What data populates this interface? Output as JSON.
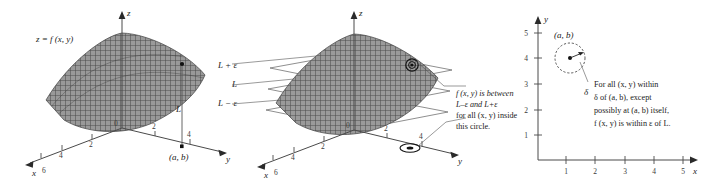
{
  "figure": {
    "kind": "three-panel-diagram",
    "topic": "epsilon-delta definition of a limit of a function of two variables",
    "ink_color": "#1a1a1a",
    "surface_color": "#8a8a8a",
    "axis_color": "#4a4a4a"
  },
  "panel_left": {
    "surface_label": "z = f (x, y)",
    "axes": {
      "z": "z",
      "y": "y",
      "x": "x"
    },
    "origin_label": "0",
    "x_ticks": [
      "2",
      "4",
      "6"
    ],
    "y_ticks": [
      "2",
      "4"
    ],
    "level_labels": [
      "L + ε",
      "L",
      "L − ε"
    ],
    "vertical_segment_label": "L",
    "base_point_label": "(a, b)"
  },
  "panel_mid": {
    "axes": {
      "z": "z",
      "y": "y",
      "x": "x"
    },
    "origin_label": "0",
    "x_ticks": [
      "2",
      "4",
      "6"
    ],
    "y_ticks": [
      "2",
      "4"
    ],
    "level_labels": [
      "L + ε",
      "L",
      "L − ε"
    ],
    "caption_lines": [
      "f (x, y) is between",
      "L–ε and L+ε",
      "for all (x, y) inside",
      "this circle."
    ]
  },
  "panel_right": {
    "axes": {
      "y": "y",
      "x": "x"
    },
    "x_ticks": [
      "1",
      "2",
      "3",
      "4",
      "5"
    ],
    "y_ticks": [
      "1",
      "2",
      "3",
      "4",
      "5"
    ],
    "point_label": "(a, b)",
    "radius_label": "δ",
    "caption_lines": [
      "For all (x, y) within",
      "δ of (a, b), except",
      "possibly at (a, b) itself,",
      "f (x, y) is within ε of L."
    ]
  }
}
